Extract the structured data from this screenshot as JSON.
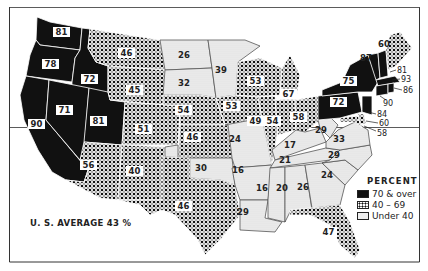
{
  "legend": {
    "title": "PERCENT",
    "items": [
      {
        "label": "70 & over",
        "category": "high",
        "color": "#111111"
      },
      {
        "label": "40 – 69",
        "category": "mid",
        "color": "#555555"
      },
      {
        "label": "Under 40",
        "category": "low",
        "color": "#dddddd"
      }
    ]
  },
  "us_average": "U. S. AVERAGE 43 %",
  "states": [
    {
      "id": "WA",
      "value": "81",
      "category": "high"
    },
    {
      "id": "OR",
      "value": "78",
      "category": "high"
    },
    {
      "id": "ID",
      "value": "72",
      "category": "high"
    },
    {
      "id": "NV",
      "value": "71",
      "category": "high"
    },
    {
      "id": "CA",
      "value": "90",
      "category": "high"
    },
    {
      "id": "UT",
      "value": "81",
      "category": "high"
    },
    {
      "id": "MT",
      "value": "46",
      "category": "mid"
    },
    {
      "id": "WY",
      "value": "45",
      "category": "mid"
    },
    {
      "id": "CO",
      "value": "51",
      "category": "mid"
    },
    {
      "id": "AZ",
      "value": "56",
      "category": "mid"
    },
    {
      "id": "NM",
      "value": "40",
      "category": "mid"
    },
    {
      "id": "ND",
      "value": "26",
      "category": "low"
    },
    {
      "id": "SD",
      "value": "32",
      "category": "low"
    },
    {
      "id": "NE",
      "value": "54",
      "category": "mid"
    },
    {
      "id": "KS",
      "value": "46",
      "category": "mid"
    },
    {
      "id": "OK",
      "value": "30",
      "category": "low"
    },
    {
      "id": "TX",
      "value": "46",
      "category": "mid"
    },
    {
      "id": "MN",
      "value": "39",
      "category": "low"
    },
    {
      "id": "IA",
      "value": "53",
      "category": "mid"
    },
    {
      "id": "MO",
      "value": "24",
      "category": "low"
    },
    {
      "id": "AR",
      "value": "16",
      "category": "low"
    },
    {
      "id": "LA",
      "value": "29",
      "category": "low"
    },
    {
      "id": "WI",
      "value": "53",
      "category": "mid"
    },
    {
      "id": "IL",
      "value": "49",
      "category": "mid"
    },
    {
      "id": "MI",
      "value": "67",
      "category": "mid"
    },
    {
      "id": "IN",
      "value": "54",
      "category": "mid"
    },
    {
      "id": "OH",
      "value": "58",
      "category": "mid"
    },
    {
      "id": "KY",
      "value": "17",
      "category": "low"
    },
    {
      "id": "TN",
      "value": "21",
      "category": "low"
    },
    {
      "id": "MS",
      "value": "16",
      "category": "low"
    },
    {
      "id": "AL",
      "value": "20",
      "category": "low"
    },
    {
      "id": "GA",
      "value": "26",
      "category": "low"
    },
    {
      "id": "FL",
      "value": "47",
      "category": "mid"
    },
    {
      "id": "SC",
      "value": "24",
      "category": "low"
    },
    {
      "id": "NC",
      "value": "29",
      "category": "low"
    },
    {
      "id": "VA",
      "value": "33",
      "category": "low"
    },
    {
      "id": "WV",
      "value": "29",
      "category": "low"
    },
    {
      "id": "PA",
      "value": "72",
      "category": "high"
    },
    {
      "id": "NY",
      "value": "75",
      "category": "high"
    },
    {
      "id": "VT",
      "value": "87",
      "category": "high"
    },
    {
      "id": "ME",
      "value": "60",
      "category": "mid"
    },
    {
      "id": "NH",
      "value": "81",
      "category": "high"
    },
    {
      "id": "MA",
      "value": "93",
      "category": "high"
    },
    {
      "id": "RI",
      "value": "86",
      "category": "high"
    },
    {
      "id": "CT",
      "value": "90",
      "category": "high"
    },
    {
      "id": "NJ",
      "value": "84",
      "category": "high"
    },
    {
      "id": "DE",
      "value": "60",
      "category": "mid"
    },
    {
      "id": "MD",
      "value": "58",
      "category": "mid"
    }
  ]
}
